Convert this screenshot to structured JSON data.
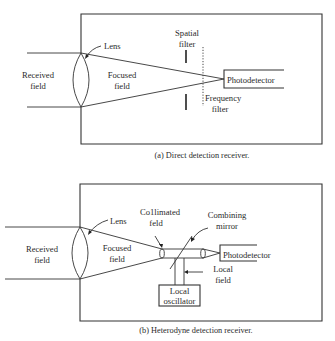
{
  "diagram_a": {
    "caption": "(a)  Direct detection receiver.",
    "labels": {
      "received_field_1": "Received",
      "received_field_2": "field",
      "lens": "Lens",
      "focused_field_1": "Focused",
      "focused_field_2": "field",
      "spatial_filter_1": "Spatial",
      "spatial_filter_2": "filter",
      "frequency_filter_1": "Frequency",
      "frequency_filter_2": "filter",
      "photodetector": "Photodetector"
    }
  },
  "diagram_b": {
    "caption": "(b)   Heterodyne detection receiver.",
    "labels": {
      "received_field_1": "Received",
      "received_field_2": "field",
      "lens": "Lens",
      "focused_field_1": "Focused",
      "focused_field_2": "field",
      "collimated_field_1": "Co1limated",
      "collimated_field_2": "feld",
      "combining_mirror_1": "Combining",
      "combining_mirror_2": "mirror",
      "photodetector": "Photodetector",
      "local_field_1": "Local",
      "local_field_2": "field",
      "local_oscillator_1": "Local",
      "local_oscillator_2": "oscillator"
    }
  },
  "colors": {
    "line": "#333333",
    "text": "#2a2a2a",
    "background": "#ffffff"
  }
}
